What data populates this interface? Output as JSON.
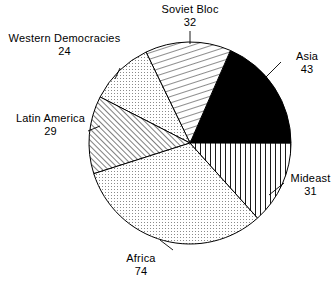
{
  "chart_data": {
    "type": "pie",
    "title": "",
    "total": 233,
    "start_angle_deg": 0,
    "direction": "counterclockwise",
    "legend": "none",
    "labels_position": "outside-with-leader-lines",
    "categories": [
      "Asia",
      "Soviet Bloc",
      "Western Democracies",
      "Latin America",
      "Africa",
      "Mideast"
    ],
    "values": [
      43,
      32,
      24,
      29,
      74,
      31
    ],
    "slices": [
      {
        "label": "Asia",
        "value": 43,
        "fill": "solid-black",
        "start_deg": 0.0,
        "sweep_deg": 66.4,
        "color": "#000000"
      },
      {
        "label": "Soviet Bloc",
        "value": 32,
        "fill": "diagonal-hatch-steep",
        "start_deg": 66.4,
        "sweep_deg": 49.4,
        "color": "#000000"
      },
      {
        "label": "Western Democracies",
        "value": 24,
        "fill": "fine-dot-stipple",
        "start_deg": 115.8,
        "sweep_deg": 37.1,
        "color": "#000000"
      },
      {
        "label": "Latin America",
        "value": 29,
        "fill": "dense-diagonal-hatch",
        "start_deg": 152.9,
        "sweep_deg": 44.8,
        "color": "#000000"
      },
      {
        "label": "Africa",
        "value": 74,
        "fill": "fine-dot-stipple",
        "start_deg": 197.7,
        "sweep_deg": 114.3,
        "color": "#000000"
      },
      {
        "label": "Mideast",
        "value": 31,
        "fill": "vertical-lines",
        "start_deg": 312.0,
        "sweep_deg": 47.9,
        "color": "#000000"
      }
    ],
    "xlabel": "",
    "ylabel": ""
  },
  "labels": {
    "soviet": {
      "name": "Soviet Bloc",
      "value": "32"
    },
    "asia": {
      "name": "Asia",
      "value": "43"
    },
    "mideast": {
      "name": "Mideast",
      "value": "31"
    },
    "africa": {
      "name": "Africa",
      "value": "74"
    },
    "latin": {
      "name": "Latin America",
      "value": "29"
    },
    "western": {
      "name": "Western Democracies",
      "value": "24"
    }
  },
  "style": {
    "stroke_color": "#000000",
    "background": "#ffffff"
  }
}
